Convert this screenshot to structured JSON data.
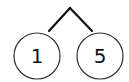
{
  "diagram": {
    "type": "number-bond",
    "whole": "",
    "parts": [
      {
        "label": "1",
        "cx": 37,
        "cy": 56,
        "r": 23
      },
      {
        "label": "5",
        "cx": 100,
        "cy": 56,
        "r": 23
      }
    ],
    "apex": {
      "x": 70,
      "y": 7
    },
    "colors": {
      "line": "#111111",
      "circle": "#333333",
      "background": "#ffffff"
    }
  }
}
